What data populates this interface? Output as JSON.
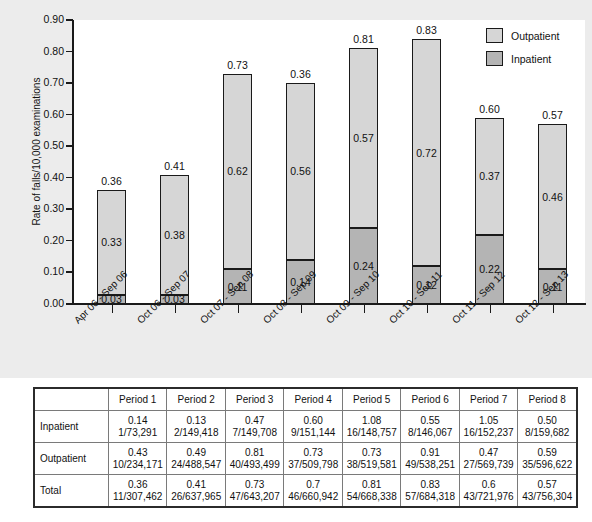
{
  "chart_data": {
    "type": "bar",
    "subtype": "stacked-bar",
    "title": "",
    "xlabel": "",
    "ylabel": "Rate of falls/10,000 examinations",
    "ylim": [
      0.0,
      0.9
    ],
    "ytick_labels": [
      "0.90",
      "0.80",
      "0.70",
      "0.60",
      "0.50",
      "0.40",
      "0.30",
      "0.20",
      "0.10",
      "0.00"
    ],
    "ytick_values": [
      0.9,
      0.8,
      0.7,
      0.6,
      0.5,
      0.4,
      0.3,
      0.2,
      0.1,
      0.0
    ],
    "grid": false,
    "legend_position": "top-right",
    "categories": [
      "Apr 06 - Sep 06",
      "Oct 06 - Sep 07",
      "Oct 07 - Sep 08",
      "Oct 08 - Sep 09",
      "Oct 09 - Sep 10",
      "Oct 10 - Sep 11",
      "Oct 11 - Sep 12",
      "Oct 12 - Sep 13"
    ],
    "series": [
      {
        "name": "Inpatient",
        "color": "#b4b4b4",
        "values": [
          0.03,
          0.03,
          0.11,
          0.14,
          0.24,
          0.12,
          0.22,
          0.11
        ]
      },
      {
        "name": "Outpatient",
        "color": "#d6d6d6",
        "values": [
          0.33,
          0.38,
          0.62,
          0.56,
          0.57,
          0.72,
          0.37,
          0.46
        ]
      }
    ],
    "totals": [
      0.36,
      0.41,
      0.73,
      0.36,
      0.81,
      0.83,
      0.6,
      0.57
    ]
  },
  "legend": {
    "items": [
      {
        "label": "Outpatient",
        "color": "#d6d6d6"
      },
      {
        "label": "Inpatient",
        "color": "#b4b4b4"
      }
    ]
  },
  "table": {
    "type": "table",
    "corner_label": "",
    "columns": [
      "Period 1",
      "Period 2",
      "Period 3",
      "Period 4",
      "Period 5",
      "Period 6",
      "Period 7",
      "Period 8"
    ],
    "rows": [
      {
        "label": "Inpatient",
        "rates": [
          "0.14",
          "0.13",
          "0.47",
          "0.60",
          "1.08",
          "0.55",
          "1.05",
          "0.50"
        ],
        "counts": [
          "1/73,291",
          "2/149,418",
          "7/149,708",
          "9/151,144",
          "16/148,757",
          "8/146,067",
          "16/152,237",
          "8/159,682"
        ]
      },
      {
        "label": "Outpatient",
        "rates": [
          "0.43",
          "0.49",
          "0.81",
          "0.73",
          "0.73",
          "0.91",
          "0.47",
          "0.59"
        ],
        "counts": [
          "10/234,171",
          "24/488,547",
          "40/493,499",
          "37/509,798",
          "38/519,581",
          "49/538,251",
          "27/569,739",
          "35/596,622"
        ]
      },
      {
        "label": "Total",
        "rates": [
          "0.36",
          "0.41",
          "0.73",
          "0.7",
          "0.81",
          "0.83",
          "0.6",
          "0.57"
        ],
        "counts": [
          "11/307,462",
          "26/637,965",
          "47/643,207",
          "46/660,942",
          "54/668,338",
          "57/684,318",
          "43/721,976",
          "43/756,304"
        ]
      }
    ]
  }
}
